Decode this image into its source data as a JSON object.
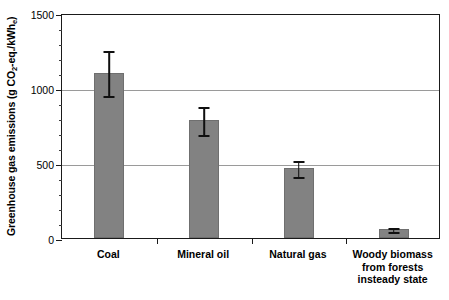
{
  "chart_data": {
    "type": "bar",
    "title": "",
    "xlabel": "",
    "ylabel": "Greenhouse gas emissions (g CO2-eq./kWhe)",
    "ylabel_parts": {
      "prefix": "Greenhouse gas emissions (g CO",
      "sub1": "2",
      "middle": "-eq./kWh",
      "sub2": "e",
      "suffix": ")"
    },
    "categories": [
      "Coal",
      "Mineral oil",
      "Natural gas",
      "Woody biomass\nfrom forests\ninsteady state"
    ],
    "values": [
      1100,
      790,
      470,
      60
    ],
    "error_low": [
      945,
      690,
      410,
      40
    ],
    "error_high": [
      1260,
      890,
      530,
      80
    ],
    "ylim": [
      0,
      1500
    ],
    "ytick_labels": [
      "0",
      "500",
      "1000",
      "1500"
    ],
    "ytick_values": [
      0,
      500,
      1000,
      1500
    ],
    "yminor_step": 100,
    "gridline_values": [
      500,
      1000
    ],
    "grid": true,
    "legend": "none",
    "bar_color": "#828282",
    "error_color": "#101010",
    "grid_color": "#9a9a9a",
    "axis_color": "#1a1a1a"
  }
}
